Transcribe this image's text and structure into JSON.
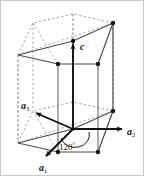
{
  "figure": {
    "background_color": "#ffffff",
    "border_color": "#c9c9c9",
    "line_color_visible": "#4d4d4d",
    "line_color_hidden": "#9a9a9a",
    "vector_color": "#111111",
    "vertex_color": "#111111"
  },
  "labels": {
    "axis_c": "c",
    "axis_a1_base": "a",
    "axis_a1_sub": "1",
    "axis_a2_base": "a",
    "axis_a2_sub": "2",
    "axis_a3_base": "a",
    "axis_a3_sub": "3",
    "angle": "120",
    "angle_unit": "°"
  },
  "geometry": {
    "shape": "hexagonal prism",
    "top_hexagon_vertices": 6,
    "bottom_hexagon_vertices": 6,
    "vertical_edges": 6,
    "origin_px": [
      72,
      128
    ],
    "apex_px": [
      72,
      40
    ],
    "prism_height_px": 88,
    "angle_between_a1_a2_degrees": 120
  },
  "vectors": [
    {
      "name": "c",
      "from_px": [
        72,
        128
      ],
      "to_px": [
        72,
        40
      ],
      "style": "solid-arrow",
      "visible": true
    },
    {
      "name": "a1",
      "from_px": [
        72,
        128
      ],
      "to_px": [
        43,
        157
      ],
      "style": "solid-arrow",
      "visible": true
    },
    {
      "name": "a2",
      "from_px": [
        72,
        128
      ],
      "to_px": [
        124,
        128
      ],
      "style": "solid-arrow",
      "visible": true
    },
    {
      "name": "a3",
      "from_px": [
        72,
        128
      ],
      "to_px": [
        32,
        110
      ],
      "style": "solid-arrow",
      "visible": true
    }
  ]
}
